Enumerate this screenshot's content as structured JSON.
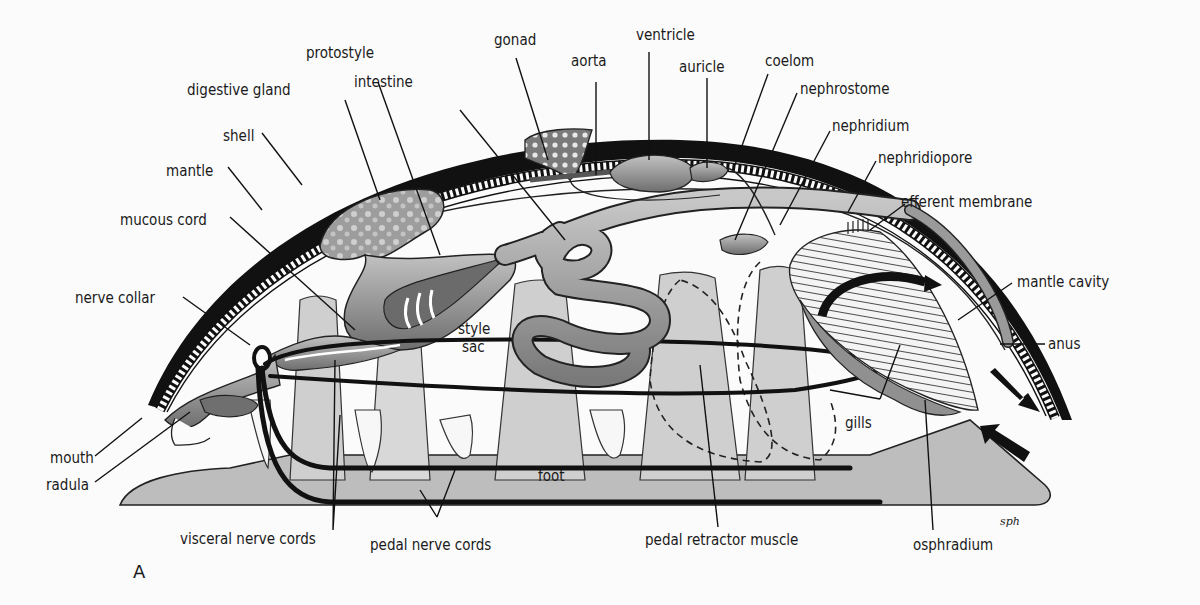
{
  "figure": {
    "panel_letter": "A",
    "signature": "sph"
  },
  "labels": {
    "protostyle": "protostyle",
    "gonad": "gonad",
    "ventricle": "ventricle",
    "aorta": "aorta",
    "auricle": "auricle",
    "coelom": "coelom",
    "intestine": "intestine",
    "digestive_gland": "digestive gland",
    "nephrostome": "nephrostome",
    "nephridium": "nephridium",
    "shell": "shell",
    "nephridiopore": "nephridiopore",
    "mantle": "mantle",
    "efferent_membrane": "efferent membrane",
    "mucous_cord": "mucous cord",
    "mantle_cavity": "mantle cavity",
    "nerve_collar": "nerve collar",
    "style_sac_1": "style",
    "style_sac_2": "sac",
    "anus": "anus",
    "gills": "gills",
    "mouth": "mouth",
    "radula": "radula",
    "foot": "foot",
    "visceral_nerve_cords": "visceral nerve cords",
    "pedal_nerve_cords": "pedal nerve cords",
    "pedal_retractor_muscle": "pedal retractor muscle",
    "osphradium": "osphradium"
  },
  "colors": {
    "background": "#fbfbfb",
    "ink": "#111111",
    "foot_fill": "#bdbdbd",
    "organ_fill": "#8f8f8f",
    "organ_light": "#c9c9c9"
  }
}
